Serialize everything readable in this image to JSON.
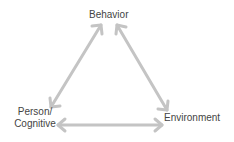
{
  "diagram": {
    "nodes": {
      "behavior": "Behavior",
      "person_line1": "Person/",
      "person_line2": "Cognitive",
      "environment": "Environment"
    },
    "edges": [
      {
        "from": "Behavior",
        "to": "Person/Cognitive",
        "type": "bidirectional"
      },
      {
        "from": "Behavior",
        "to": "Environment",
        "type": "bidirectional"
      },
      {
        "from": "Person/Cognitive",
        "to": "Environment",
        "type": "bidirectional"
      }
    ],
    "colors": {
      "arrow": "#c4c4c4",
      "text": "#444444"
    }
  }
}
